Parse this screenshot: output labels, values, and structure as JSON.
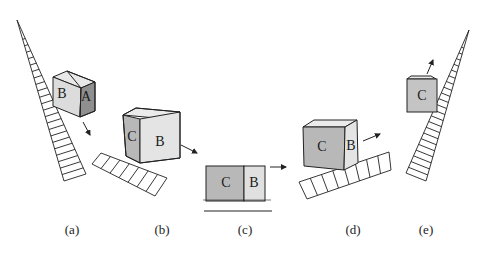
{
  "figure": {
    "panels": [
      {
        "id": "a",
        "caption": "(a)",
        "faces": [
          "B",
          "A"
        ],
        "description": "cube entering steep ladder slope, face A front dark"
      },
      {
        "id": "b",
        "caption": "(b)",
        "faces": [
          "C",
          "B"
        ],
        "description": "cube tilted over gentle ladder, moving right"
      },
      {
        "id": "c",
        "caption": "(c)",
        "faces": [
          "C",
          "B"
        ],
        "description": "flat view of box on ground line, arrow right"
      },
      {
        "id": "d",
        "caption": "(d)",
        "faces": [
          "C",
          "B"
        ],
        "description": "cube on rising ladder, arrow up-right"
      },
      {
        "id": "e",
        "caption": "(e)",
        "faces": [
          "C"
        ],
        "description": "cube leaving steep ladder, arrow up"
      }
    ]
  },
  "colors": {
    "line": "#222222",
    "dark_face": "#8f8f8f",
    "mid_face": "#b8b8b8",
    "light_face": "#dedede",
    "lighter_face": "#ebebeb"
  }
}
